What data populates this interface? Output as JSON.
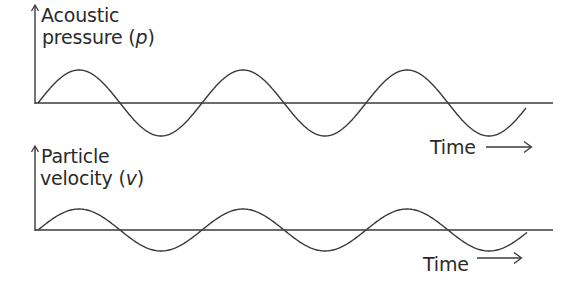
{
  "diagram": {
    "colors": {
      "line": "#3a3a3a",
      "text": "#2a2a2a",
      "background": "#ffffff"
    },
    "panels": [
      {
        "id": "pressure",
        "ylabel_line1": "Acoustic",
        "ylabel_line2_prefix": "pressure (",
        "ylabel_symbol": "p",
        "ylabel_line2_suffix": ")",
        "xlabel": "Time",
        "axis_x": 35,
        "axis_top": 5,
        "baseline_y": 103,
        "baseline_end_x": 553,
        "amplitude": 33,
        "wave_start_x": 38,
        "period": 164,
        "wave_end_x": 526,
        "phase": "sine"
      },
      {
        "id": "velocity",
        "ylabel_line1": "Particle",
        "ylabel_line2_prefix": "velocity (",
        "ylabel_symbol": "v",
        "ylabel_line2_suffix": ")",
        "xlabel": "Time",
        "axis_x": 35,
        "axis_top": 146,
        "baseline_y": 230,
        "baseline_end_x": 553,
        "amplitude": 21,
        "wave_start_x": 38,
        "period": 164,
        "wave_end_x": 527,
        "phase": "sine"
      }
    ],
    "note": "Pressure and particle velocity are in phase; velocity has smaller amplitude"
  }
}
